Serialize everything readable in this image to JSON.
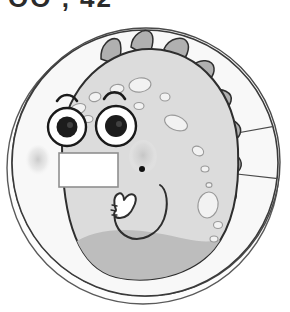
{
  "page": {
    "background_color": "#ffffff",
    "width": 290,
    "height": 312
  },
  "top_text": {
    "clipped_line": "OO , 42",
    "note_visible": "bottom edges of cut-off characters only"
  },
  "badge": {
    "name": "dinosaur-character-badge",
    "shape": "circle",
    "outer_ring_color": "#fdfdfd",
    "outer_ring_stroke": "#4a4a4a",
    "inner_disc_color": "#f7f7f7",
    "inner_disc_stroke": "#3a3a3a",
    "divider_line_color": "#4a4a4a",
    "divider_count": 3
  },
  "character": {
    "name": "dinosaur",
    "body_color": "#dcdcdc",
    "body_stroke": "#2e2e2e",
    "belly_shadow_color": "#bdbdbd",
    "spot_color": "#f2f2f2",
    "spot_stroke": "#9a9a9a",
    "spike_color": "#b0b0b0",
    "spike_stroke": "#2e2e2e",
    "spike_count": 8,
    "spot_count": 19
  },
  "face": {
    "eye_white": "#ffffff",
    "eye_stroke": "#1a1a1a",
    "pupil_color": "#1c1c1c",
    "pupil_highlight": "#5a5a5a",
    "eyebrow_color": "#1a1a1a",
    "eyebrow_count": 2,
    "cheek_blush_color": "#cfcfcf",
    "cheek_count": 2,
    "nose_dot_color": "#111111",
    "mouth_stroke": "#2e2e2e"
  },
  "label_plate": {
    "name": "blank-name-label",
    "fill": "#ffffff",
    "stroke": "#8f8f8f",
    "text": "",
    "placeholder": ""
  },
  "arm": {
    "name": "thumbs-up-arm",
    "gesture": "thumbs-up",
    "fill": "#ffffff",
    "stroke": "#2e2e2e"
  }
}
